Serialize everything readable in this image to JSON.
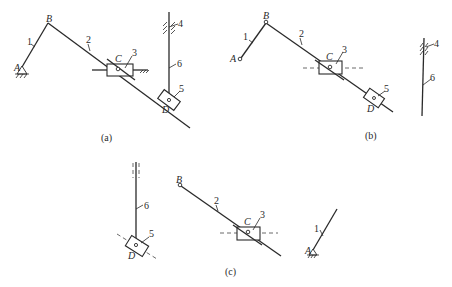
{
  "figure": {
    "panels": [
      {
        "id": "a",
        "caption": "(a)",
        "points": {
          "A": "A",
          "B": "B",
          "C": "C",
          "D": "D"
        },
        "members": {
          "m1": "1",
          "m2": "2",
          "m3": "3",
          "m4": "4",
          "m5": "5",
          "m6": "6"
        }
      },
      {
        "id": "b",
        "caption": "(b)",
        "points": {
          "A": "A",
          "B": "B",
          "C": "C",
          "D": "D"
        },
        "members": {
          "m1": "1",
          "m2": "2",
          "m3": "3",
          "m4": "4",
          "m5": "5",
          "m6": "6"
        }
      },
      {
        "id": "c",
        "caption": "(c)",
        "points": {
          "A": "A",
          "B": "B",
          "C": "C",
          "D": "D"
        },
        "members": {
          "m1": "1",
          "m2": "2",
          "m3": "3",
          "m5": "5",
          "m6": "6"
        }
      }
    ]
  }
}
